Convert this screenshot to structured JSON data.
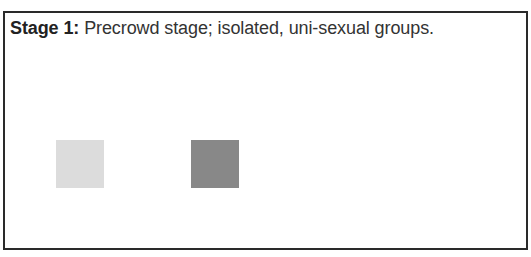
{
  "diagram": {
    "caption": {
      "label": "Stage 1:",
      "text": " Precrowd stage; isolated, uni-sexual groups."
    },
    "groups": [
      {
        "name": "light-group",
        "color": "#dcdcdc"
      },
      {
        "name": "dark-group",
        "color": "#888888"
      }
    ]
  }
}
